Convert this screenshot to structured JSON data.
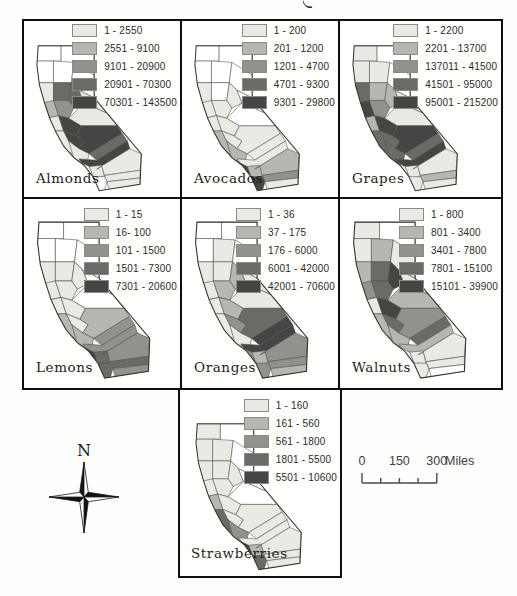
{
  "colors": {
    "class0": "#ffffff",
    "class1": "#eae9e3",
    "class2": "#b7b6b0",
    "class3": "#92918b",
    "class4": "#6b6a66",
    "class5": "#454543",
    "panel_border": "#0e0e0e",
    "county_line": "#55544f",
    "state_outline": "#333330"
  },
  "panels": [
    {
      "id": "almonds",
      "label": "Almonds",
      "legend": [
        "1 - 2550",
        "2551 - 9100",
        "9101 - 20900",
        "20901 - 70300",
        "70301 - 143500"
      ],
      "county_classes": [
        0,
        0,
        0,
        0,
        0,
        1,
        4,
        4,
        1,
        2,
        3,
        1,
        5,
        1,
        1,
        5,
        5,
        1,
        4,
        5,
        1,
        0,
        1,
        1,
        1,
        0,
        1
      ]
    },
    {
      "id": "avocados",
      "label": "Avocados",
      "legend": [
        "1 - 200",
        "201 - 1200",
        "1201 - 4700",
        "4701 - 9300",
        "9301 - 29800"
      ],
      "county_classes": [
        0,
        0,
        0,
        0,
        0,
        1,
        0,
        1,
        0,
        1,
        1,
        1,
        1,
        0,
        2,
        1,
        1,
        2,
        1,
        1,
        3,
        5,
        2,
        2,
        3,
        5,
        1
      ]
    },
    {
      "id": "grapes",
      "label": "Grapes",
      "legend": [
        "1 - 2200",
        "2201 - 13700",
        "137011 - 41500",
        "41501 - 95000",
        "95001 - 215200"
      ],
      "county_classes": [
        1,
        0,
        1,
        1,
        0,
        4,
        2,
        2,
        1,
        5,
        3,
        2,
        5,
        1,
        4,
        4,
        5,
        4,
        4,
        5,
        3,
        1,
        1,
        1,
        2,
        1,
        1
      ]
    },
    {
      "id": "lemons",
      "label": "Lemons",
      "legend": [
        "1 - 15",
        "16- 100",
        "101 - 1500",
        "1501 - 7300",
        "7301 - 20600"
      ],
      "county_classes": [
        0,
        0,
        0,
        0,
        0,
        1,
        1,
        1,
        0,
        1,
        1,
        1,
        1,
        0,
        2,
        1,
        2,
        2,
        3,
        3,
        3,
        5,
        4,
        3,
        4,
        4,
        3
      ]
    },
    {
      "id": "oranges",
      "label": "Oranges",
      "legend": [
        "1 - 36",
        "37 - 175",
        "176 - 6000",
        "6001 - 42000",
        "42001 - 70600"
      ],
      "county_classes": [
        0,
        0,
        0,
        1,
        0,
        1,
        1,
        2,
        1,
        1,
        2,
        1,
        2,
        1,
        1,
        3,
        4,
        1,
        5,
        5,
        1,
        3,
        2,
        3,
        3,
        3,
        2
      ]
    },
    {
      "id": "walnuts",
      "label": "Walnuts",
      "legend": [
        "1 - 800",
        "801 - 3400",
        "3401 - 7800",
        "7801 - 15100",
        "15101 - 39900"
      ],
      "county_classes": [
        1,
        0,
        1,
        2,
        1,
        2,
        4,
        5,
        1,
        3,
        4,
        1,
        5,
        2,
        2,
        4,
        3,
        2,
        4,
        2,
        3,
        1,
        1,
        1,
        1,
        1,
        0
      ]
    },
    {
      "id": "strawberries",
      "label": "Strawberries",
      "legend": [
        "1 - 160",
        "161 - 560",
        "561 - 1800",
        "1801 - 5500",
        "5501 - 10600"
      ],
      "county_classes": [
        1,
        0,
        1,
        1,
        0,
        1,
        1,
        1,
        0,
        1,
        1,
        2,
        1,
        0,
        4,
        1,
        1,
        3,
        1,
        1,
        5,
        5,
        2,
        1,
        1,
        4,
        1
      ]
    }
  ],
  "compass": {
    "north_label": "N"
  },
  "scale_bar": {
    "tick_labels": [
      "0",
      "150",
      "300"
    ],
    "unit_label": "Miles",
    "tick_miles": [
      0,
      75,
      150,
      225,
      300
    ]
  }
}
